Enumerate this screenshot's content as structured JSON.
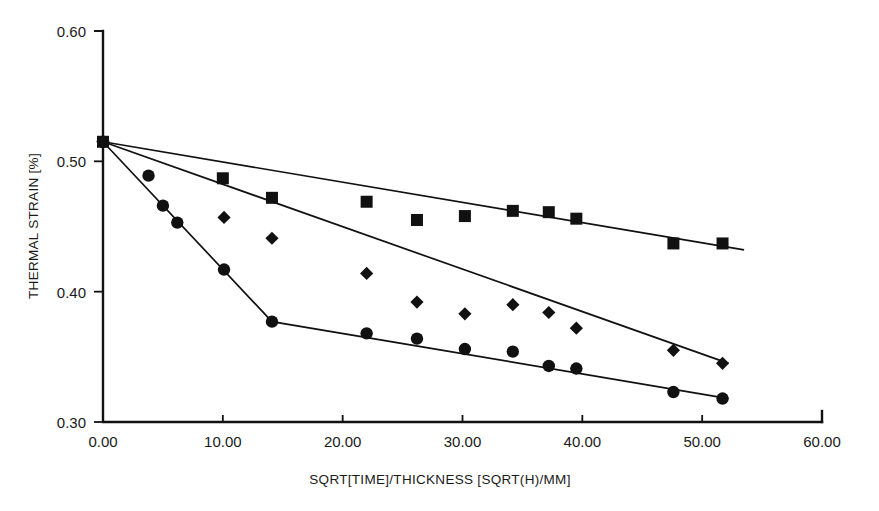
{
  "chart_data": {
    "type": "scatter",
    "title": "",
    "xlabel": "SQRT[TIME]/THICKNESS [SQRT(H)/MM]",
    "ylabel": "THERMAL STRAIN [%]",
    "xlim": [
      0.0,
      60.0
    ],
    "ylim": [
      0.3,
      0.6
    ],
    "xticks": [
      "0.00",
      "10.00",
      "20.00",
      "30.00",
      "40.00",
      "50.00",
      "60.00"
    ],
    "xtick_values": [
      0,
      10,
      20,
      30,
      40,
      50,
      60
    ],
    "yticks": [
      "0.30",
      "0.40",
      "0.50",
      "0.60"
    ],
    "ytick_values": [
      0.3,
      0.4,
      0.5,
      0.6
    ],
    "grid": false,
    "legend": "none",
    "marker_color": "#111111",
    "line_color": "#111111",
    "series": [
      {
        "name": "series-squares",
        "marker": "square",
        "x": [
          0.0,
          10.0,
          14.1,
          22.0,
          26.2,
          30.2,
          34.2,
          37.2,
          39.5,
          47.6,
          51.7
        ],
        "y": [
          0.515,
          0.487,
          0.472,
          0.469,
          0.455,
          0.458,
          0.462,
          0.461,
          0.456,
          0.437,
          0.437
        ],
        "fit_x": [
          0.0,
          53.5
        ],
        "fit_y": [
          0.515,
          0.432
        ]
      },
      {
        "name": "series-diamonds",
        "marker": "diamond",
        "x": [
          0.0,
          10.1,
          14.1,
          22.0,
          26.2,
          30.2,
          34.2,
          37.2,
          39.5,
          47.6,
          51.7
        ],
        "y": [
          0.515,
          0.457,
          0.441,
          0.414,
          0.392,
          0.383,
          0.39,
          0.384,
          0.372,
          0.355,
          0.345
        ],
        "fit_x": [
          0.0,
          52.2
        ],
        "fit_y": [
          0.515,
          0.345
        ]
      },
      {
        "name": "series-circles",
        "marker": "circle",
        "x": [
          0.0,
          3.8,
          5.0,
          6.2,
          10.1,
          14.1,
          22.0,
          26.2,
          30.2,
          34.2,
          37.2,
          39.5,
          47.6,
          51.7
        ],
        "y": [
          0.515,
          0.489,
          0.466,
          0.453,
          0.417,
          0.377,
          0.368,
          0.364,
          0.356,
          0.354,
          0.343,
          0.341,
          0.323,
          0.318
        ],
        "fit_x": [
          0.0,
          14.1,
          52.2
        ],
        "fit_y": [
          0.515,
          0.377,
          0.318
        ]
      }
    ]
  }
}
